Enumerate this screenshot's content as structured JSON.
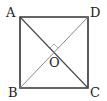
{
  "diagram": {
    "type": "square-with-diagonals",
    "points": {
      "A": {
        "label": "A",
        "x": 20,
        "y": 17
      },
      "D": {
        "label": "D",
        "x": 88,
        "y": 17
      },
      "B": {
        "label": "B",
        "x": 20,
        "y": 88
      },
      "C": {
        "label": "C",
        "x": 88,
        "y": 88
      },
      "O": {
        "label": "O",
        "x": 54,
        "y": 52
      }
    },
    "segments": [
      "AD",
      "DC",
      "CB",
      "BA",
      "AC",
      "BD"
    ],
    "annotations": [
      "right-angle at O between OA and OD"
    ],
    "colors": {
      "stroke": "#333333",
      "diagonal_light": "#888888",
      "background": "#ffffff"
    }
  }
}
